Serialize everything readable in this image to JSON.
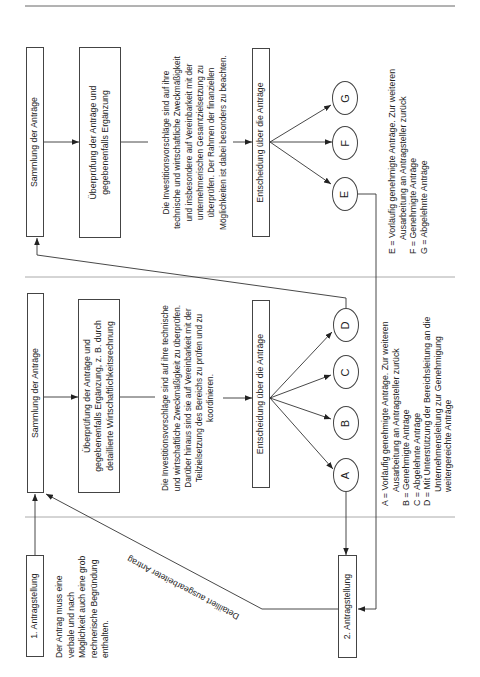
{
  "colors": {
    "line": "#333333",
    "divider": "#a0a0a0",
    "header_rule": "#666666",
    "text": "#222222",
    "background": "#ffffff"
  },
  "upper_section": {
    "collection_box": "Sammlung der Anträge",
    "review_box": [
      "Überprüfung der Anträge und",
      "gegebenenfalls Ergänzung"
    ],
    "review_note": [
      "Die Investitionsvorschläge sind auf ihre",
      "technische und wirtschaftliche Zweckmäßigkeit",
      "und insbesondere auf Vereinbarkeit mit der",
      "unternehmerischen Gesamtzielsetzung zu",
      "überprüfen. Der Rahmen der finanziellen",
      "Möglichkeiten ist dabei besonders zu beachten."
    ],
    "decision_box": "Entscheidung über die Anträge",
    "outcomes": {
      "E": "E",
      "F": "F",
      "G": "G"
    },
    "legend": [
      {
        "text": "E = Vorläufig genehmigte Anträge. Zur weiteren",
        "continuation": false
      },
      {
        "text": "Ausarbeitung an Antragsteller zurück",
        "continuation": true
      },
      {
        "text": "F = Genehmigte Anträge",
        "continuation": false
      },
      {
        "text": "G = Abgelehnte Anträge",
        "continuation": false
      }
    ]
  },
  "middle_section": {
    "collection_box": "Sammlung der Anträge",
    "review_box": [
      "Überprüfung der Anträge und",
      "gegebenenfalls Ergänzung, z. B. durch",
      "detaillierte Wirtschaftlichkeitsrechnung"
    ],
    "review_note": [
      "Die Investitionsvorschläge sind auf ihre technische",
      "und wirtschaftliche Zweckmäßigkeit zu überprüfen.",
      "Darüber hinaus sind sie auf Vereinbarkeit mit der",
      "Teilzielsetzung des Bereichs zu prüfen und zu",
      "koordinieren."
    ],
    "decision_box": "Entscheidung über die Anträge",
    "outcomes": {
      "A": "A",
      "B": "B",
      "C": "C",
      "D": "D"
    },
    "legend": [
      {
        "text": "A = Vorläufig genehmigte Anträge. Zur weiteren",
        "continuation": false
      },
      {
        "text": "Ausarbeitung an Antragsteller zurück",
        "continuation": true
      },
      {
        "text": "B = Genehmigte Anträge",
        "continuation": false
      },
      {
        "text": "C = Abgelehnte Anträge",
        "continuation": false
      },
      {
        "text": "D = Mit Unterstützung der Bereichsleitung an die",
        "continuation": false
      },
      {
        "text": "Unternehmensleitung zur Genehmigung",
        "continuation": true
      },
      {
        "text": "weitergereichte Anträge",
        "continuation": true
      }
    ]
  },
  "lower_section": {
    "first_application_box": "1. Antragstellung",
    "first_application_note": [
      "Der Antrag muss eine",
      "verbale und nach",
      "Möglichkeit auch eine grob",
      "rechnerische Begründung",
      "enthalten."
    ],
    "second_application_box": "2. Antragstellung",
    "detailed_application_label": "Detailliert ausgearbeiteter Antrag"
  }
}
